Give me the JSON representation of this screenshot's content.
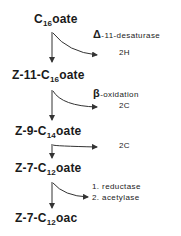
{
  "compounds": [
    {
      "prefix": "C",
      "sub": "16",
      "suffix": "oate"
    },
    {
      "prefix": "Z-11-C",
      "sub": "16",
      "suffix": "oate"
    },
    {
      "prefix": "Z-9-C",
      "sub": "14",
      "suffix": "oate"
    },
    {
      "prefix": "Z-7-C",
      "sub": "12",
      "suffix": "oate"
    },
    {
      "prefix": "Z-7-C",
      "sub": "12",
      "suffix": "oac"
    }
  ],
  "steps": [
    {
      "symbol": "Δ",
      "enzyme": "-11-desaturase",
      "product": "2H"
    },
    {
      "symbol": "β",
      "enzyme": "-oxidation",
      "product": "2C"
    },
    {
      "product": "2C"
    },
    {
      "enzymes": [
        "1. reductase",
        "2. acetylase"
      ]
    }
  ],
  "colors": {
    "ink": "#1a1a1a",
    "background": "#ffffff"
  }
}
